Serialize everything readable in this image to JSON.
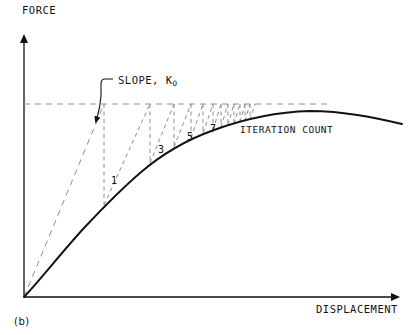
{
  "figure": {
    "caption": "(b)",
    "background_color": "#ffffff",
    "ink_color": "#111111",
    "construction_color": "#8c8c8c"
  },
  "axes": {
    "y_label": "FORCE",
    "x_label": "DISPLACEMENT",
    "origin": {
      "x": 24,
      "y": 297
    },
    "y_top": {
      "x": 24,
      "y": 35
    },
    "x_right": {
      "x": 400,
      "y": 297
    }
  },
  "annotations": {
    "slope_label": "SLOPE, K",
    "slope_label_subscript": "O",
    "iteration_count_label": "ITERATION COUNT"
  },
  "iteration_labels": [
    {
      "text": "1",
      "x": 111,
      "y": 175
    },
    {
      "text": "3",
      "x": 158,
      "y": 144
    },
    {
      "text": "5",
      "x": 187,
      "y": 131
    },
    {
      "text": "7",
      "x": 210,
      "y": 123
    }
  ],
  "chart_data": {
    "type": "line",
    "title": "",
    "xlabel": "DISPLACEMENT",
    "ylabel": "FORCE",
    "grid": false,
    "legend": null,
    "series": [
      {
        "name": "nonlinear-response-curve",
        "style": "solid",
        "points": [
          [
            24,
            297
          ],
          [
            34,
            285
          ],
          [
            45,
            272
          ],
          [
            56,
            259
          ],
          [
            67,
            246
          ],
          [
            79,
            233
          ],
          [
            91,
            220
          ],
          [
            103,
            207
          ],
          [
            112,
            196
          ],
          [
            122,
            186
          ],
          [
            133,
            176
          ],
          [
            144,
            167
          ],
          [
            155,
            159
          ],
          [
            166,
            152
          ],
          [
            177,
            146
          ],
          [
            188,
            140
          ],
          [
            199,
            135
          ],
          [
            210,
            131
          ],
          [
            222,
            127
          ],
          [
            234,
            124
          ],
          [
            247,
            120
          ],
          [
            260,
            117
          ],
          [
            274,
            114
          ],
          [
            288,
            112
          ],
          [
            302,
            111
          ],
          [
            316,
            111
          ],
          [
            330,
            112
          ],
          [
            345,
            114
          ],
          [
            360,
            116
          ],
          [
            375,
            119
          ],
          [
            390,
            122
          ],
          [
            402,
            124
          ]
        ]
      },
      {
        "name": "applied-load-level",
        "style": "dashed",
        "points": [
          [
            24,
            104
          ],
          [
            330,
            104
          ]
        ]
      },
      {
        "name": "initial-stiffness-tangent",
        "style": "dashed",
        "points": [
          [
            24,
            297
          ],
          [
            104,
            104
          ]
        ]
      }
    ],
    "iteration_steps": [
      {
        "n": 1,
        "curve_x": 104,
        "curve_y": 205,
        "level_x": 104
      },
      {
        "n": 2,
        "curve_x": 150,
        "curve_y": 163,
        "level_x": 150
      },
      {
        "n": 3,
        "curve_x": 150,
        "curve_y": 163,
        "level_x": 174
      },
      {
        "n": 4,
        "curve_x": 174,
        "curve_y": 147,
        "level_x": 191
      },
      {
        "n": 5,
        "curve_x": 191,
        "curve_y": 138,
        "level_x": 203
      },
      {
        "n": 6,
        "curve_x": 203,
        "curve_y": 133,
        "level_x": 213
      },
      {
        "n": 7,
        "curve_x": 213,
        "curve_y": 130,
        "level_x": 221
      },
      {
        "n": 8,
        "curve_x": 221,
        "curve_y": 127,
        "level_x": 228
      },
      {
        "n": 9,
        "curve_x": 228,
        "curve_y": 125,
        "level_x": 234
      },
      {
        "n": 10,
        "curve_x": 234,
        "curve_y": 124,
        "level_x": 240
      },
      {
        "n": 11,
        "curve_x": 240,
        "curve_y": 122,
        "level_x": 245
      },
      {
        "n": 12,
        "curve_x": 245,
        "curve_y": 121,
        "level_x": 250
      }
    ],
    "xlim": [
      24,
      410
    ],
    "ylim": [
      297,
      35
    ]
  }
}
